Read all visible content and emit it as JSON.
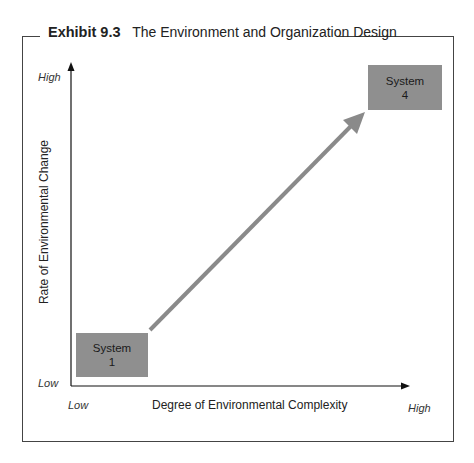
{
  "exhibit": {
    "number": "Exhibit 9.3",
    "title": "The Environment and Organization Design"
  },
  "axes": {
    "y": {
      "title": "Rate of Environmental Change",
      "low": "Low",
      "high": "High"
    },
    "x": {
      "title": "Degree of Environmental Complexity",
      "low": "Low",
      "high": "High"
    }
  },
  "nodes": [
    {
      "id": "system-1",
      "line1": "System",
      "line2": "1",
      "position": "low complexity / low change"
    },
    {
      "id": "system-4",
      "line1": "System",
      "line2": "4",
      "position": "high complexity / high change"
    }
  ],
  "edges": [
    {
      "from": "system-1",
      "to": "system-4",
      "style": "gray arrow"
    }
  ],
  "colors": {
    "box_fill": "#8f8f8f",
    "arrow": "#8a8a8a",
    "axis": "#111111",
    "frame": "#444444"
  }
}
